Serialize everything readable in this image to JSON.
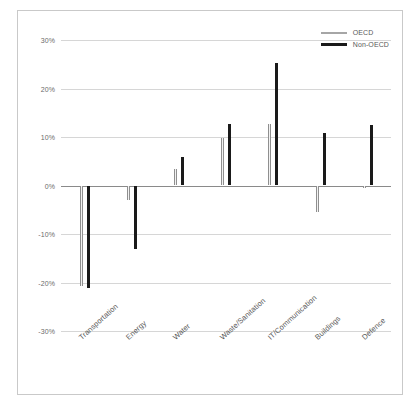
{
  "chart_data": {
    "type": "bar",
    "title": "",
    "subtitle": "",
    "xlabel": "",
    "ylabel": "",
    "ylim": [
      -30,
      30
    ],
    "ytick_labels": [
      "30%",
      "20%",
      "10%",
      "0%",
      "-10%",
      "-20%",
      "-30%"
    ],
    "ytick_values": [
      30,
      20,
      10,
      0,
      -10,
      -20,
      -30
    ],
    "grid": true,
    "legend_position": "top-right",
    "categories": [
      "Transportation",
      "Energy",
      "Water",
      "Waste/Sanitation",
      "IT/Communication",
      "Buildings",
      "Defence"
    ],
    "series": [
      {
        "name": "OECD",
        "color": "#a6a6a6",
        "values": [
          -20.7,
          -3.0,
          3.5,
          9.8,
          12.7,
          -5.5,
          -0.6
        ]
      },
      {
        "name": "Non-OECD",
        "color": "#1a1a1a",
        "values": [
          -21.1,
          -13.0,
          5.8,
          12.6,
          25.3,
          10.8,
          12.4
        ]
      }
    ]
  },
  "legend": {
    "items": [
      {
        "label": "OECD",
        "color": "#a6a6a6"
      },
      {
        "label": "Non-OECD",
        "color": "#1a1a1a"
      }
    ]
  }
}
